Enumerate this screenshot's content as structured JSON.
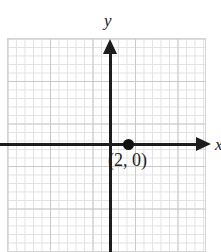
{
  "figure": {
    "name": "cartesian-coordinate-plane-with-point",
    "background_color": "#ffffff",
    "axis_color": "#1c1c1c",
    "grid_minor_color": "#e2e2e2",
    "grid_major_color": "#c9c9c9",
    "point_color": "#111111"
  },
  "axes": {
    "y_label": "y",
    "x_label": "x",
    "x_axis_name": "horizontal-axis",
    "y_axis_name": "vertical-axis",
    "x_arrow_direction": "right",
    "y_arrow_direction": "up",
    "origin_px": {
      "x": 111,
      "y": 145
    },
    "units_per_minor_cell": 1,
    "minor_cells_per_major": 5,
    "pixels_per_unit": 8.5
  },
  "chart_data": {
    "type": "scatter",
    "title": "",
    "xlabel": "x",
    "ylabel": "y",
    "grid": true,
    "legend": "none",
    "points": [
      {
        "label": "(2, 0)",
        "x": 2,
        "y": 0
      }
    ]
  },
  "point": {
    "label": "(2, 0)",
    "x": 2,
    "y": 0
  }
}
